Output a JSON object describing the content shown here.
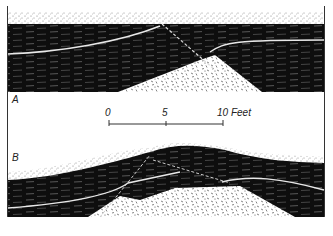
{
  "figure": {
    "panels": [
      {
        "id": "A",
        "label": "A",
        "description": "Flat-lying strata over granite with fault line"
      },
      {
        "id": "B",
        "label": "B",
        "description": "Strata arched over granite dome with faults"
      }
    ],
    "scale_bar": {
      "ticks": [
        "0",
        "5",
        "10"
      ],
      "unit": "Feet",
      "end_label": "10 Feet"
    },
    "legend": {
      "stipple": "surface soil / sand",
      "black_strata": "sedimentary layers",
      "white_line": "marker bed",
      "granite": "granite / crystalline rock",
      "dashed_line": "fault"
    },
    "colors": {
      "ink": "#111111",
      "paper": "#ffffff",
      "stipple": "#777777"
    }
  }
}
